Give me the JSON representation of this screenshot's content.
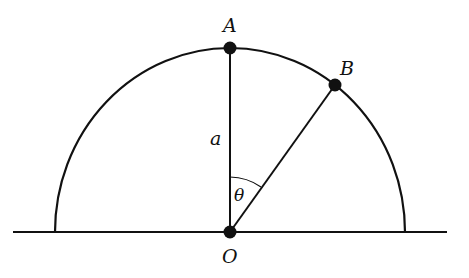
{
  "diagram": {
    "type": "geometry",
    "colors": {
      "stroke": "#111111",
      "background": "#ffffff"
    },
    "points": {
      "A": {
        "label": "A"
      },
      "B": {
        "label": "B"
      },
      "O": {
        "label": "O"
      }
    },
    "segment_label": "a",
    "angle_label": "θ"
  }
}
